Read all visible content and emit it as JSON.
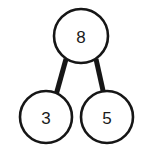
{
  "diagram": {
    "kind": "number-bond",
    "background_color": "#ffffff",
    "stroke_color": "#161616",
    "text_color": "#1a1a1a",
    "canvas": {
      "width": 149,
      "height": 150
    },
    "nodes": [
      {
        "id": "whole",
        "role": "whole",
        "value": "8",
        "cx": 81,
        "cy": 36,
        "r": 27,
        "stroke_width": 2.6,
        "font_size": 17
      },
      {
        "id": "part-left",
        "role": "part",
        "value": "3",
        "cx": 46,
        "cy": 117,
        "r": 26,
        "stroke_width": 2.6,
        "font_size": 17
      },
      {
        "id": "part-right",
        "role": "part",
        "value": "5",
        "cx": 107,
        "cy": 117,
        "r": 26,
        "stroke_width": 2.6,
        "font_size": 17
      }
    ],
    "links": [
      {
        "id": "link-whole-left",
        "from": "whole",
        "to": "part-left",
        "x1": 66,
        "y1": 59,
        "x2": 56,
        "y2": 95,
        "stroke_width": 5
      },
      {
        "id": "link-whole-right",
        "from": "whole",
        "to": "part-right",
        "x1": 96,
        "y1": 59,
        "x2": 104,
        "y2": 95,
        "stroke_width": 5
      }
    ]
  },
  "chart_data": {
    "type": "diagram",
    "subtype": "number-bond",
    "whole": 8,
    "parts": [
      3,
      5
    ],
    "relation": "3 + 5 = 8",
    "labels": [
      "8",
      "3",
      "5"
    ]
  }
}
